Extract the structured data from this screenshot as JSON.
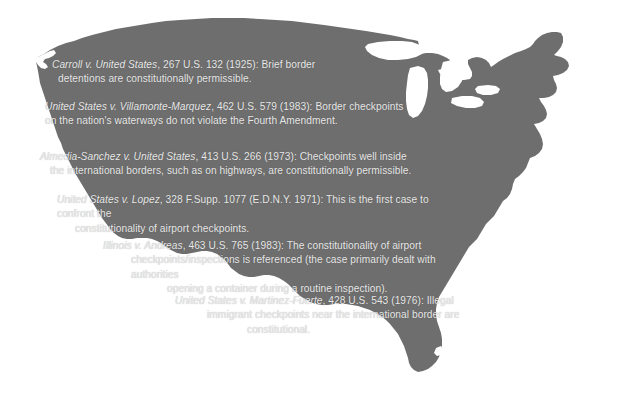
{
  "figure": {
    "title_partial": "",
    "map_label": "united-states-silhouette",
    "map_fill_color": "#6e6e6e",
    "text_color": "#e8e8e8",
    "background_color": "#ffffff"
  },
  "notes": [
    {
      "id": "carroll",
      "case_name": "Carroll v. United States",
      "citation": ", 267 U.S. 132 (1925):",
      "lines": [
        " Brief border",
        "detentions are constitutionally permissible."
      ]
    },
    {
      "id": "villamonte-marquez",
      "case_name": "United States v. Villamonte-Marquez",
      "citation": ", 462 U.S. 579 (1983):",
      "lines": [
        " Border checkpoints",
        "on the nation's waterways do not violate the Fourth Amendment."
      ]
    },
    {
      "id": "almedia-sanchez",
      "case_name": "Almedia-Sanchez v. United States",
      "citation": ", 413 U.S. 266 (1973):",
      "lines": [
        " Checkpoints well inside",
        "the international borders, such as on highways, are constitutionally permissible."
      ]
    },
    {
      "id": "lopez",
      "case_name": "United States v. Lopez",
      "citation": ", 328 F.Supp. 1077 (E.D.N.Y. 1971):",
      "lines": [
        " This is the first case to confront the",
        "constitutionality of airport checkpoints."
      ]
    },
    {
      "id": "andreas",
      "case_name": "Illinois v. Andreas",
      "citation": ", 463 U.S. 765 (1983):",
      "lines": [
        " The constitutionality of airport",
        "checkpoints/inspections is referenced (the case primarily dealt with authorities",
        "opening a container during a routine inspection)."
      ]
    },
    {
      "id": "martinez-fuerte",
      "case_name": "United States v. Martinez-Fuerte",
      "citation": ", 428 U.S. 543 (1976):",
      "lines": [
        " Illegal",
        "immigrant checkpoints near the international border are",
        "constitutional."
      ]
    }
  ]
}
